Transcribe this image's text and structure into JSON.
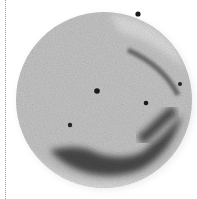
{
  "image": {
    "subject": "round specimen disc",
    "palette": {
      "background": "#ffffff",
      "disc_fill": "#c4c4c4",
      "disc_light": "#d6d6d6",
      "dark_region": "#3a3a3a",
      "spot": "#1a1a1a",
      "guide_line": "#9a9a9a"
    },
    "disc": {
      "cx": 104,
      "cy": 100,
      "rx": 88,
      "ry": 88
    },
    "spots": [
      {
        "x": 138,
        "y": 14,
        "r": 2.6
      },
      {
        "x": 97,
        "y": 91,
        "r": 2.8
      },
      {
        "x": 146,
        "y": 103,
        "r": 2.3
      },
      {
        "x": 70,
        "y": 125,
        "r": 2.2
      },
      {
        "x": 180,
        "y": 84,
        "r": 2.0
      }
    ]
  }
}
